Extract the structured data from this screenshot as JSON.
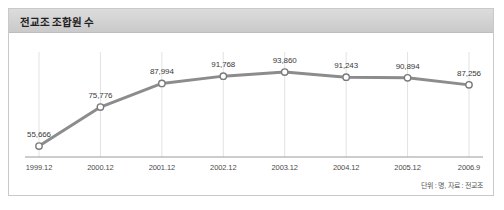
{
  "card": {
    "title": "전교조 조합원 수",
    "footnote": "단위 : 명, 자료 : 전교조"
  },
  "chart_data": {
    "type": "line",
    "title": "전교조 조합원 수",
    "xlabel": "",
    "ylabel": "",
    "unit_note": "단위 : 명, 자료 : 전교조",
    "categories": [
      "1999.12",
      "2000.12",
      "2001.12",
      "2002.12",
      "2003.12",
      "2004.12",
      "2005.12",
      "2006.9"
    ],
    "values": [
      55666,
      75776,
      87994,
      91768,
      93860,
      91243,
      90894,
      87256
    ],
    "value_labels": [
      "55,666",
      "75,776",
      "87,994",
      "91,768",
      "93,860",
      "91,243",
      "90,894",
      "87,256"
    ],
    "ylim": [
      50000,
      97000
    ],
    "grid": "vertical",
    "legend": "none",
    "series": [
      {
        "name": "전교조 조합원 수",
        "values": [
          55666,
          75776,
          87994,
          91768,
          93860,
          91243,
          90894,
          87256
        ]
      }
    ],
    "style": {
      "line_color": "#8c8c8c",
      "marker_fill": "#ffffff",
      "marker_stroke": "#7a7a7a",
      "grid_color": "#e2e2e2",
      "axis_color": "#9a9a9a"
    }
  }
}
